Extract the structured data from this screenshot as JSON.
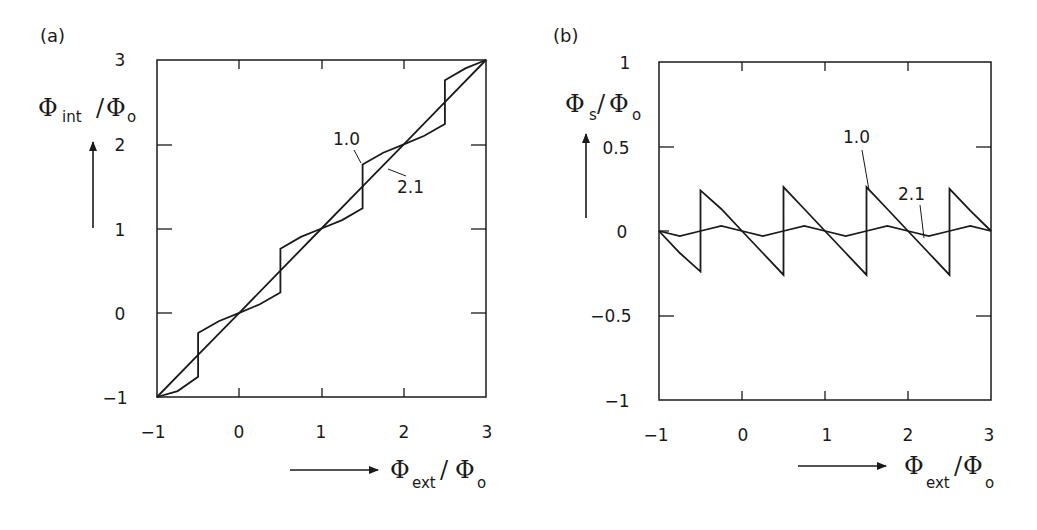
{
  "figure": {
    "panels": [
      {
        "id": "a",
        "label": "(a)",
        "ylabel": {
          "symbol": "Φ",
          "sub": "int",
          "slash": "/",
          "denom": "Φ",
          "denom_sub": "o"
        },
        "xlabel": {
          "symbol": "Φ",
          "sub": "ext",
          "slash": "/",
          "denom": "Φ",
          "denom_sub": "o"
        },
        "xticks": [
          "−1",
          "0",
          "1",
          "2",
          "3"
        ],
        "yticks": [
          "3",
          "2",
          "1",
          "0",
          "−1"
        ],
        "curve_labels": [
          "1.0",
          "2.1"
        ]
      },
      {
        "id": "b",
        "label": "(b)",
        "ylabel": {
          "symbol": "Φ",
          "sub": "s",
          "slash": "/",
          "denom": "Φ",
          "denom_sub": "o"
        },
        "xlabel": {
          "symbol": "Φ",
          "sub": "ext",
          "slash": "/",
          "denom": "Φ",
          "denom_sub": "o"
        },
        "xticks": [
          "−1",
          "0",
          "1",
          "2",
          "3"
        ],
        "yticks": [
          "1",
          "0.5",
          "0",
          "−0.5",
          "−1"
        ],
        "curve_labels": [
          "1.0",
          "2.1"
        ]
      }
    ]
  },
  "chart_data": [
    {
      "type": "line",
      "title": "(a)",
      "xlabel": "Φext/Φo",
      "ylabel": "Φint/Φo",
      "xlim": [
        -1,
        3
      ],
      "ylim": [
        -1,
        3
      ],
      "xticks": [
        -1,
        0,
        1,
        2,
        3
      ],
      "yticks": [
        -1,
        0,
        1,
        2,
        3
      ],
      "grid": false,
      "legend": "inline curve labels",
      "series": [
        {
          "name": "1.0",
          "x": [
            -1,
            -0.75,
            -0.5,
            -0.5,
            -0.25,
            0,
            0.25,
            0.5,
            0.5,
            0.75,
            1,
            1.25,
            1.5,
            1.5,
            1.75,
            2,
            2.25,
            2.5,
            2.5,
            2.75,
            3
          ],
          "y": [
            -1,
            -0.93,
            -0.76,
            -0.24,
            -0.1,
            0,
            0.1,
            0.24,
            0.76,
            0.9,
            1,
            1.1,
            1.24,
            1.76,
            1.9,
            2,
            2.1,
            2.24,
            2.76,
            2.9,
            3
          ]
        },
        {
          "name": "2.1",
          "x": [
            -1,
            -0.5,
            0,
            0.5,
            1,
            1.5,
            2,
            2.5,
            3
          ],
          "y": [
            -1,
            -0.5,
            0,
            0.5,
            1,
            1.5,
            2,
            2.5,
            3
          ]
        }
      ]
    },
    {
      "type": "line",
      "title": "(b)",
      "xlabel": "Φext/Φo",
      "ylabel": "Φs/Φo",
      "xlim": [
        -1,
        3
      ],
      "ylim": [
        -1,
        1
      ],
      "xticks": [
        -1,
        0,
        1,
        2,
        3
      ],
      "yticks": [
        -1,
        -0.5,
        0,
        0.5,
        1
      ],
      "grid": false,
      "legend": "inline curve labels",
      "series": [
        {
          "name": "1.0",
          "x": [
            -1,
            -0.75,
            -0.5,
            -0.5,
            -0.25,
            0,
            0.25,
            0.5,
            0.5,
            0.75,
            1,
            1.25,
            1.5,
            1.5,
            1.75,
            2,
            2.25,
            2.5,
            2.5,
            2.75,
            3
          ],
          "y": [
            0,
            -0.13,
            -0.24,
            0.24,
            0.13,
            0,
            -0.13,
            -0.26,
            0.26,
            0.13,
            0,
            -0.13,
            -0.26,
            0.26,
            0.13,
            0,
            -0.13,
            -0.26,
            0.25,
            0.12,
            0
          ]
        },
        {
          "name": "2.1",
          "x": [
            -1,
            -0.75,
            -0.5,
            -0.25,
            0,
            0.25,
            0.5,
            0.75,
            1,
            1.25,
            1.5,
            1.75,
            2,
            2.25,
            2.5,
            2.75,
            3
          ],
          "y": [
            0,
            -0.03,
            0,
            0.03,
            0,
            -0.03,
            0,
            0.03,
            0,
            -0.03,
            0,
            0.03,
            0,
            -0.03,
            0,
            0.03,
            0
          ]
        }
      ]
    }
  ]
}
